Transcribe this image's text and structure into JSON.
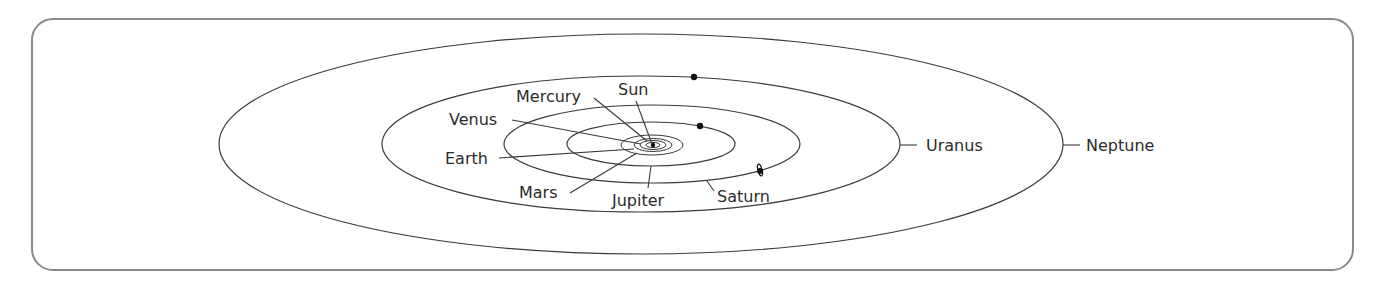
{
  "diagram": {
    "sun": {
      "label": "Sun",
      "x": 652,
      "y": 145
    },
    "orbits": [
      {
        "name": "Mercury",
        "cx": 652,
        "cy": 145,
        "rx": 6,
        "ry": 2.5
      },
      {
        "name": "Venus",
        "cx": 652,
        "cy": 145,
        "rx": 11,
        "ry": 4
      },
      {
        "name": "Earth",
        "cx": 652,
        "cy": 145,
        "rx": 16,
        "ry": 6
      },
      {
        "name": "Mars",
        "cx": 652,
        "cy": 145,
        "rx": 31,
        "ry": 10
      },
      {
        "name": "Jupiter",
        "cx": 651,
        "cy": 144,
        "rx": 84,
        "ry": 22
      },
      {
        "name": "Saturn",
        "cx": 652,
        "cy": 144,
        "rx": 148,
        "ry": 39
      },
      {
        "name": "Uranus",
        "cx": 641,
        "cy": 144,
        "rx": 259,
        "ry": 68
      },
      {
        "name": "Neptune",
        "cx": 641,
        "cy": 144,
        "rx": 422,
        "ry": 110
      }
    ],
    "labels": {
      "sun": "Sun",
      "mercury": "Mercury",
      "venus": "Venus",
      "earth": "Earth",
      "mars": "Mars",
      "jupiter": "Jupiter",
      "saturn": "Saturn",
      "uranus": "Uranus",
      "neptune": "Neptune"
    },
    "planet_markers": [
      {
        "name": "Jupiter",
        "x": 700,
        "y": 126
      },
      {
        "name": "Saturn",
        "x": 760,
        "y": 171
      },
      {
        "name": "Uranus",
        "x": 694,
        "y": 77
      }
    ],
    "colors": {
      "line": "#3a3a3a",
      "text": "#2b2b2b",
      "frame": "#8a8a8a",
      "background": "#ffffff"
    }
  }
}
